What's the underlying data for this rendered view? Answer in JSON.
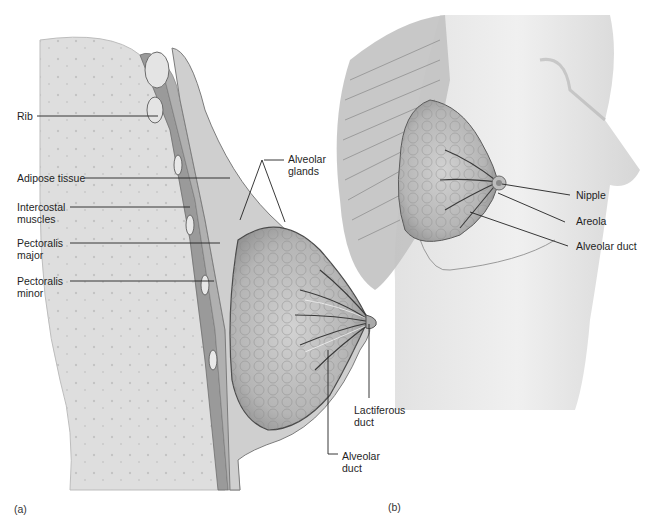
{
  "figure": {
    "panel_a": {
      "letter": "(a)",
      "labels": {
        "rib": "Rib",
        "adipose": "Adipose tissue",
        "intercostal_1": "Intercostal",
        "intercostal_2": "muscles",
        "pect_major_1": "Pectoralis",
        "pect_major_2": "major",
        "pect_minor_1": "Pectoralis",
        "pect_minor_2": "minor",
        "alveolar_glands_1": "Alveolar",
        "alveolar_glands_2": "glands",
        "lactiferous_1": "Lactiferous",
        "lactiferous_2": "duct",
        "alveolar_duct_1": "Alveolar",
        "alveolar_duct_2": "duct"
      }
    },
    "panel_b": {
      "letter": "(b)",
      "labels": {
        "nipple": "Nipple",
        "areola": "Areola",
        "alveolar_duct": "Alveolar duct"
      }
    },
    "colors": {
      "ink": "#1f1f1f",
      "chest_fill": "#dcdcdc",
      "gland_fill": "#b8b8b8",
      "skin_fill": "#e6e6e6"
    }
  }
}
